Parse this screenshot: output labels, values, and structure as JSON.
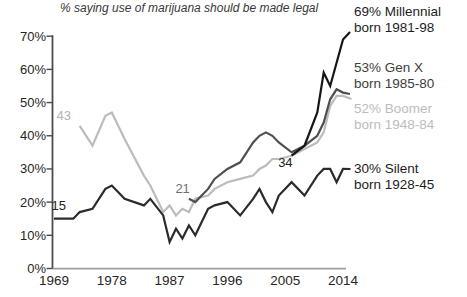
{
  "title": "% saying use of marijuana should be made legal",
  "chart_data": {
    "type": "line",
    "title": "% saying use of marijuana should be made legal",
    "xlabel": "",
    "ylabel": "",
    "x_ticks": [
      "1969",
      "1978",
      "1987",
      "1996",
      "2005",
      "2014"
    ],
    "y_ticks": [
      "0%",
      "10%",
      "20%",
      "30%",
      "40%",
      "50%",
      "60%",
      "70%"
    ],
    "x_range": [
      1969,
      2014
    ],
    "y_range": [
      0,
      70
    ],
    "grid": false,
    "legend_position": "right",
    "series": [
      {
        "name": "Boomer",
        "color": "#bcbcbc",
        "points": [
          [
            1973,
            43
          ],
          [
            1975,
            37
          ],
          [
            1977,
            46
          ],
          [
            1978,
            47
          ],
          [
            1980,
            39
          ],
          [
            1983,
            28
          ],
          [
            1984,
            25
          ],
          [
            1986,
            17
          ],
          [
            1987,
            19
          ],
          [
            1988,
            16
          ],
          [
            1989,
            18
          ],
          [
            1990,
            17
          ],
          [
            1991,
            21
          ],
          [
            1993,
            22
          ],
          [
            1994,
            24
          ],
          [
            1996,
            26
          ],
          [
            1998,
            27
          ],
          [
            2000,
            28
          ],
          [
            2001,
            30
          ],
          [
            2002,
            31
          ],
          [
            2003,
            33
          ],
          [
            2004,
            33
          ],
          [
            2006,
            34
          ],
          [
            2008,
            36
          ],
          [
            2010,
            38
          ],
          [
            2011,
            41
          ],
          [
            2012,
            49
          ],
          [
            2013,
            52
          ],
          [
            2014,
            52
          ]
        ]
      },
      {
        "name": "Gen X",
        "color": "#4f4f4f",
        "points": [
          [
            1990,
            21
          ],
          [
            1991,
            20
          ],
          [
            1993,
            24
          ],
          [
            1994,
            27
          ],
          [
            1996,
            30
          ],
          [
            1998,
            32
          ],
          [
            2000,
            38
          ],
          [
            2001,
            40
          ],
          [
            2002,
            41
          ],
          [
            2003,
            40
          ],
          [
            2004,
            38
          ],
          [
            2006,
            35
          ],
          [
            2008,
            37
          ],
          [
            2010,
            40
          ],
          [
            2011,
            44
          ],
          [
            2012,
            51
          ],
          [
            2013,
            54
          ],
          [
            2014,
            53
          ]
        ]
      },
      {
        "name": "Silent",
        "color": "#2b2b2b",
        "points": [
          [
            1969,
            15
          ],
          [
            1972,
            15
          ],
          [
            1973,
            17
          ],
          [
            1975,
            18
          ],
          [
            1977,
            24
          ],
          [
            1978,
            25
          ],
          [
            1980,
            21
          ],
          [
            1983,
            19
          ],
          [
            1984,
            21
          ],
          [
            1986,
            16
          ],
          [
            1987,
            8
          ],
          [
            1988,
            12
          ],
          [
            1989,
            9
          ],
          [
            1990,
            13
          ],
          [
            1991,
            10
          ],
          [
            1993,
            18
          ],
          [
            1994,
            19
          ],
          [
            1996,
            20
          ],
          [
            1998,
            16
          ],
          [
            2000,
            21
          ],
          [
            2001,
            24
          ],
          [
            2002,
            20
          ],
          [
            2003,
            17
          ],
          [
            2004,
            22
          ],
          [
            2006,
            26
          ],
          [
            2008,
            22
          ],
          [
            2010,
            28
          ],
          [
            2011,
            30
          ],
          [
            2012,
            30
          ],
          [
            2013,
            26
          ],
          [
            2014,
            30
          ]
        ]
      },
      {
        "name": "Millennial",
        "color": "#161616",
        "points": [
          [
            2006,
            34
          ],
          [
            2008,
            37
          ],
          [
            2010,
            47
          ],
          [
            2011,
            59
          ],
          [
            2012,
            55
          ],
          [
            2014,
            69
          ]
        ]
      }
    ],
    "annotations": [
      {
        "text": "15",
        "year": 1968.6,
        "value": 21,
        "color": "#222222"
      },
      {
        "text": "43",
        "year": 1969.4,
        "value": 48,
        "color": "#b3b3b3"
      },
      {
        "text": "21",
        "year": 1987.9,
        "value": 26,
        "color": "#6f6f6f"
      },
      {
        "text": "34",
        "year": 2003.9,
        "value": 34,
        "color": "#222222"
      }
    ]
  },
  "legend": {
    "entries": [
      {
        "value_label": "69% Millennial",
        "born_label": "born 1981-98",
        "color": "#1d1d1d"
      },
      {
        "value_label": "53% Gen X",
        "born_label": "born 1985-80",
        "color": "#3d3d3d"
      },
      {
        "value_label": "52% Boomer",
        "born_label": "born 1948-84",
        "color": "#bcbcbc"
      },
      {
        "value_label": "30% Silent",
        "born_label": "born 1928-45",
        "color": "#1d1d1d"
      }
    ]
  }
}
